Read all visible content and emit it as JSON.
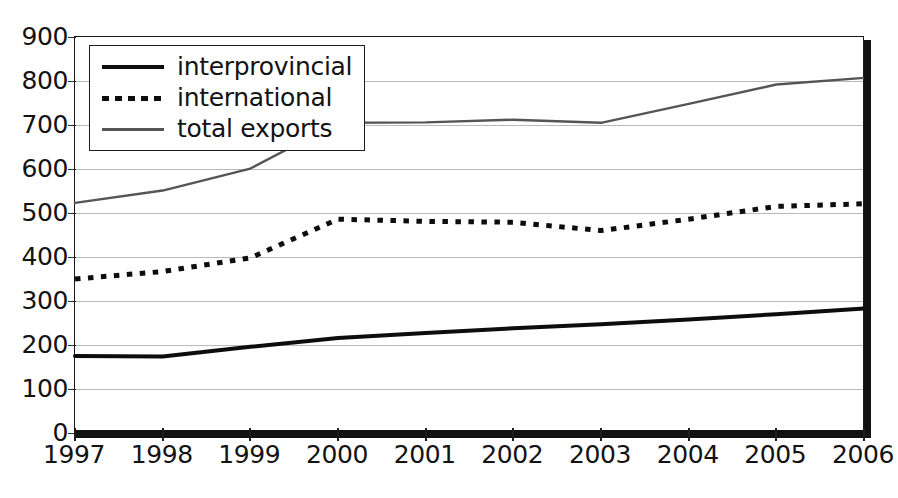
{
  "chart_data": {
    "type": "line",
    "title": "",
    "subtitle": "",
    "xlabel": "",
    "ylabel": "",
    "x": [
      1997,
      1998,
      1999,
      2000,
      2001,
      2002,
      2003,
      2004,
      2005,
      2006
    ],
    "categories": [
      "1997",
      "1998",
      "1999",
      "2000",
      "2001",
      "2002",
      "2003",
      "2004",
      "2005",
      "2006"
    ],
    "xlim": [
      1997,
      2006
    ],
    "ylim": [
      0,
      900
    ],
    "y_ticks": [
      0,
      100,
      200,
      300,
      400,
      500,
      600,
      700,
      800,
      900
    ],
    "y_tick_labels": [
      "0",
      "100",
      "200",
      "300",
      "400",
      "500",
      "600",
      "700",
      "800",
      "900"
    ],
    "grid": "horizontal",
    "legend_position": "top-left-inside",
    "series": [
      {
        "name": "interprovincial",
        "style": "solid-thick",
        "color": "#0d0d0d",
        "values": [
          175,
          174,
          196,
          216,
          227,
          238,
          247,
          258,
          270,
          283
        ]
      },
      {
        "name": "international",
        "style": "dotted",
        "color": "#0d0d0d",
        "values": [
          350,
          367,
          398,
          486,
          481,
          479,
          460,
          486,
          515,
          521
        ]
      },
      {
        "name": "total exports",
        "style": "solid-thin",
        "color": "#555555",
        "values": [
          523,
          551,
          601,
          705,
          706,
          712,
          705,
          748,
          792,
          807
        ]
      }
    ]
  },
  "legend": {
    "items": [
      {
        "label": "interprovincial",
        "swatch": "solid-thick-line-icon"
      },
      {
        "label": "international",
        "swatch": "dotted-line-icon"
      },
      {
        "label": "total exports",
        "swatch": "solid-thin-line-icon"
      }
    ]
  }
}
